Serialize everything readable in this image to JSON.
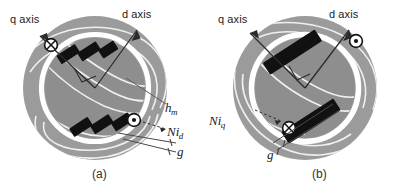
{
  "figure": {
    "type": "diagram",
    "colors": {
      "background": "#ffffff",
      "stator_iron": "#9a9a9a",
      "rotor_iron": "#8f8f8f",
      "airgap_ring": "#ffffff",
      "magnet": "#101010",
      "flux_line": "#f2f2f2",
      "axis_line": "#2b2b2b",
      "text": "#1a1a1a"
    }
  },
  "panels": [
    {
      "id": "a",
      "caption": "(a)",
      "labels": {
        "q_axis": "q axis",
        "d_axis": "d axis",
        "magnet_height": "h",
        "magnet_height_sub": "m",
        "mmf": "Ni",
        "mmf_sub": "d",
        "airgap": "g"
      },
      "markers": [
        {
          "name": "current-into-page",
          "glyph": "cross-in-circle",
          "axis": "q"
        },
        {
          "name": "current-out-of-page",
          "glyph": "dot-in-circle",
          "axis": "d"
        }
      ],
      "magnets": 6,
      "magnet_style": "stepped-segmented-V"
    },
    {
      "id": "b",
      "caption": "(b)",
      "labels": {
        "q_axis": "q axis",
        "d_axis": "d axis",
        "mmf": "Ni",
        "mmf_sub": "q",
        "airgap": "g"
      },
      "markers": [
        {
          "name": "current-out-of-page",
          "glyph": "dot-in-circle",
          "axis": "d"
        },
        {
          "name": "current-into-page",
          "glyph": "cross-in-circle",
          "axis": "q"
        }
      ],
      "magnets": 2,
      "magnet_style": "solid-bar-V"
    }
  ]
}
